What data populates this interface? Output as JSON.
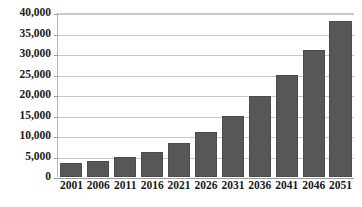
{
  "chart_data": {
    "type": "bar",
    "title": "",
    "subtitle": "",
    "xlabel": "",
    "ylabel": "",
    "categories": [
      "2001",
      "2006",
      "2011",
      "2016",
      "2021",
      "2026",
      "2031",
      "2036",
      "2041",
      "2046",
      "2051"
    ],
    "values": [
      3300,
      3800,
      4800,
      6100,
      8200,
      11000,
      15000,
      19700,
      25000,
      31000,
      38000
    ],
    "series": [
      {
        "name": "",
        "values": [
          3300,
          3800,
          4800,
          6100,
          8200,
          11000,
          15000,
          19700,
          25000,
          31000,
          38000
        ]
      }
    ],
    "ylim": [
      0,
      40000
    ],
    "ytick_values": [
      0,
      5000,
      10000,
      15000,
      20000,
      25000,
      30000,
      35000,
      40000
    ],
    "ytick_labels": [
      "0",
      "5,000",
      "10,000",
      "15,000",
      "20,000",
      "25,000",
      "30,000",
      "35,000",
      "40,000"
    ],
    "grid": true,
    "grid_axis": "y",
    "legend": false,
    "legend_position": "none",
    "annotations": [],
    "colors": {
      "bar_fill": "#575757",
      "bar_border": "#4b4b4b",
      "gridline": "#c9c9c9",
      "axis_line": "#9a9a9a",
      "background": "#ffffff",
      "tick_text": "#1a1a1a"
    }
  }
}
